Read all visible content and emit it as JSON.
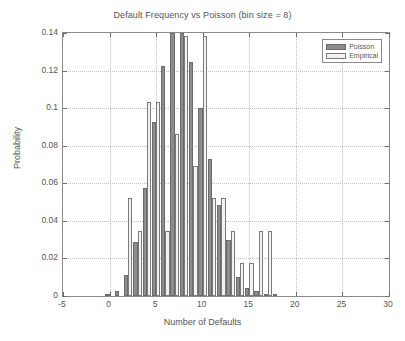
{
  "chart_data": {
    "type": "bar",
    "title": "Default Frequency vs Poisson (bin size = 8)",
    "xlabel": "Number of Defaults",
    "ylabel": "Probability",
    "xlim": [
      -5,
      30
    ],
    "ylim": [
      0,
      0.14
    ],
    "xticks": [
      -5,
      0,
      5,
      10,
      15,
      20,
      25,
      30
    ],
    "yticks": [
      0,
      0.02,
      0.04,
      0.06,
      0.08,
      0.1,
      0.12,
      0.14
    ],
    "xtick_labels": [
      "-5",
      "0",
      "5",
      "10",
      "15",
      "20",
      "25",
      "30"
    ],
    "ytick_labels": [
      "0",
      "0.02",
      "0.04",
      "0.06",
      "0.08",
      "0.1",
      "0.12",
      "0.14"
    ],
    "grid": true,
    "grid_style": "dotted",
    "legend_position": "top-right",
    "categories": [
      0,
      1,
      2,
      3,
      4,
      5,
      6,
      7,
      8,
      9,
      10,
      11,
      12,
      13,
      14,
      15,
      16,
      17,
      18,
      19,
      20
    ],
    "series": [
      {
        "name": "Poisson",
        "color": "#8c8c8c",
        "values": [
          0.0005,
          0.0025,
          0.011,
          0.0285,
          0.0575,
          0.0925,
          0.1225,
          0.145,
          0.14,
          0.1245,
          0.1,
          0.073,
          0.0485,
          0.03,
          0.01,
          0.0045,
          0.0025,
          0.0008,
          0.0003,
          0.0,
          0.0
        ]
      },
      {
        "name": "Empirical",
        "color": "#f2f2f2",
        "values": [
          0.0,
          0.0,
          0.052,
          0.0345,
          0.1035,
          0.1035,
          0.0345,
          0.0865,
          0.1385,
          0.069,
          0.1385,
          0.052,
          0.052,
          0.0345,
          0.0175,
          0.0175,
          0.0345,
          0.0345,
          0.0,
          0.0,
          0.0
        ]
      }
    ]
  },
  "legend": {
    "items": [
      {
        "label": "Poisson"
      },
      {
        "label": "Empirical"
      }
    ]
  }
}
